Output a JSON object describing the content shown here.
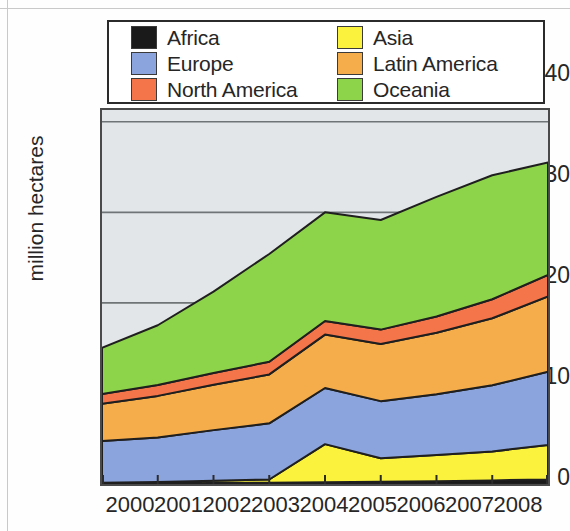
{
  "chart_data": {
    "type": "area",
    "stacked": true,
    "title": "",
    "subtitle": "",
    "xlabel": "",
    "ylabel": "million hectares",
    "x": [
      2000,
      2001,
      2002,
      2003,
      2004,
      2005,
      2006,
      2007,
      2008
    ],
    "categories": [
      "2000",
      "2001",
      "2002",
      "2003",
      "2004",
      "2005",
      "2006",
      "2007",
      "2008"
    ],
    "xtick_labels": [
      "2000",
      "2001",
      "2002",
      "2003",
      "2004",
      "2005",
      "2006",
      "2007",
      "2008"
    ],
    "ytick_labels": [
      "0",
      "10",
      "20",
      "30",
      "40"
    ],
    "ytick_values": [
      0,
      10,
      20,
      30,
      40
    ],
    "ylim": [
      0,
      41.3
    ],
    "xlim": [
      2000,
      2008
    ],
    "grid": "horizontal-gridlines-at-20-and-30",
    "legend_position": "above-plot",
    "plot_background": "#e3e6e8",
    "series": [
      {
        "name": "Africa",
        "color": "#1a1a1a",
        "values": [
          0.05,
          0.08,
          0.1,
          0.15,
          0.2,
          0.25,
          0.3,
          0.4,
          0.5
        ]
      },
      {
        "name": "Asia",
        "color": "#faf23c",
        "values": [
          0.1,
          0.15,
          0.25,
          0.35,
          4.2,
          2.6,
          2.9,
          3.2,
          3.8
        ]
      },
      {
        "name": "Europe",
        "color": "#8ba4dd",
        "values": [
          4.6,
          4.9,
          5.6,
          6.2,
          6.2,
          6.3,
          6.7,
          7.3,
          8.1
        ]
      },
      {
        "name": "Latin America",
        "color": "#f5ac4a",
        "values": [
          4.1,
          4.6,
          5.0,
          5.4,
          5.9,
          6.3,
          6.8,
          7.4,
          8.3
        ]
      },
      {
        "name": "North America",
        "color": "#f4754a",
        "values": [
          1.1,
          1.2,
          1.3,
          1.4,
          1.5,
          1.6,
          1.8,
          2.1,
          2.4
        ]
      },
      {
        "name": "Oceania",
        "color": "#8ed44a",
        "values": [
          5.1,
          6.6,
          9.0,
          11.9,
          12.0,
          12.1,
          13.2,
          13.7,
          12.4
        ]
      }
    ],
    "stack_totals": [
      15.05,
      17.53,
      21.25,
      25.4,
      30.0,
      29.15,
      31.7,
      34.1,
      35.5
    ]
  },
  "legend": {
    "items": [
      {
        "label": "Africa",
        "color": "#1a1a1a",
        "swatch": "africa-swatch"
      },
      {
        "label": "Asia",
        "color": "#faf23c",
        "swatch": "asia-swatch"
      },
      {
        "label": "Europe",
        "color": "#8ba4dd",
        "swatch": "europe-swatch"
      },
      {
        "label": "Latin America",
        "color": "#f5ac4a",
        "swatch": "latin-america-swatch"
      },
      {
        "label": "North America",
        "color": "#f4754a",
        "swatch": "north-america-swatch"
      },
      {
        "label": "Oceania",
        "color": "#8ed44a",
        "swatch": "oceania-swatch"
      }
    ]
  },
  "axes": {
    "y_label": "million hectares",
    "y_ticks": [
      "40",
      "30",
      "20",
      "10",
      "0"
    ],
    "x_ticks": [
      "2000",
      "2001",
      "2002",
      "2003",
      "2004",
      "2005",
      "2006",
      "2007",
      "2008"
    ]
  }
}
